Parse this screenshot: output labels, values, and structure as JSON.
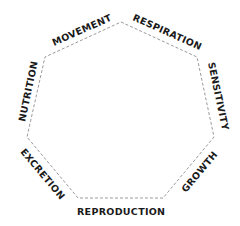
{
  "diagram": {
    "shape": "heptagon",
    "line_color": "#9a9a9a",
    "text_color": "#1a1a1a",
    "labels": {
      "movement": "MOVEMENT",
      "respiration": "RESPIRATION",
      "sensitivity": "SENSITIVITY",
      "growth": "GROWTH",
      "reproduction": "REPRODUCTION",
      "excretion": "EXCRETION",
      "nutrition": "NUTRITION"
    }
  }
}
